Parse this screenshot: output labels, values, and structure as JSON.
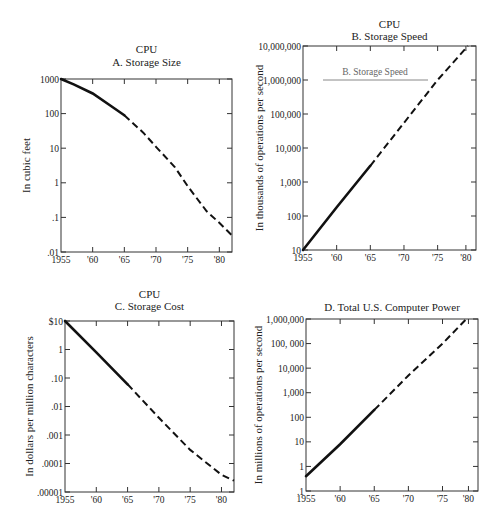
{
  "chart_data": [
    {
      "id": "A",
      "type": "line",
      "supertitle": "CPU",
      "title": "A. Storage Size",
      "xlabel": "",
      "ylabel": "In cubic feet",
      "yscale": "log",
      "ylim": [
        0.01,
        1000
      ],
      "xlim": [
        1955,
        1982
      ],
      "x_tick_labels": [
        "1955",
        "'60",
        "'65",
        "'70",
        "'75",
        "'80"
      ],
      "x_ticks": [
        1955,
        1960,
        1965,
        1970,
        1975,
        1980
      ],
      "y_tick_labels": [
        "1000",
        "100",
        "10",
        "1",
        ".1",
        ".01"
      ],
      "y_ticks": [
        1000,
        100,
        10,
        1,
        0.1,
        0.01
      ],
      "grid": false,
      "solid_until": 1965,
      "x": [
        1955,
        1957,
        1960,
        1963,
        1965,
        1968,
        1970,
        1973,
        1975,
        1978,
        1980,
        1982
      ],
      "values": [
        1000,
        700,
        380,
        160,
        90,
        28,
        11,
        2.8,
        0.8,
        0.15,
        0.07,
        0.03
      ]
    },
    {
      "id": "B",
      "type": "line",
      "supertitle": "CPU",
      "title": "B. Storage Speed",
      "legend_label": "B. Storage Speed",
      "xlabel": "",
      "ylabel": "In thousands of operations per second",
      "yscale": "log",
      "ylim": [
        10,
        10000000
      ],
      "xlim": [
        1955,
        1980.7
      ],
      "x_tick_labels": [
        "1955",
        "'60",
        "'65",
        "'70",
        "'75",
        "'80"
      ],
      "x_ticks": [
        1955,
        1960,
        1965,
        1970,
        1975,
        1979.2
      ],
      "y_tick_labels": [
        "10,000,000",
        "1,000,000",
        "100,000",
        "10,000",
        "1,000",
        "100",
        "10"
      ],
      "y_ticks": [
        10000000,
        1000000,
        100000,
        10000,
        1000,
        100,
        10
      ],
      "grid": false,
      "solid_until": 1965,
      "x": [
        1955,
        1960,
        1965,
        1970,
        1975,
        1979.5
      ],
      "values": [
        10,
        180,
        3000,
        55000,
        1000000,
        10000000
      ]
    },
    {
      "id": "C",
      "type": "line",
      "supertitle": "CPU",
      "title": "C. Storage Cost",
      "xlabel": "",
      "ylabel": "In dollars per million characters",
      "yscale": "log",
      "ylim": [
        1e-05,
        10
      ],
      "xlim": [
        1955,
        1982
      ],
      "x_tick_labels": [
        "1955",
        "'60",
        "'65",
        "'70",
        "'75",
        "'80"
      ],
      "x_ticks": [
        1955,
        1960,
        1965,
        1970,
        1975,
        1980
      ],
      "y_tick_labels": [
        "$10",
        "1",
        ".10",
        ".01",
        ".001",
        ".0001",
        ".00001"
      ],
      "y_ticks": [
        10,
        1,
        0.1,
        0.01,
        0.001,
        0.0001,
        1e-05
      ],
      "grid": false,
      "solid_until": 1965,
      "x": [
        1955,
        1960,
        1965,
        1970,
        1975,
        1980,
        1982
      ],
      "values": [
        10,
        0.8,
        0.06,
        0.004,
        0.0003,
        4e-05,
        2.5e-05
      ]
    },
    {
      "id": "D",
      "type": "line",
      "supertitle": "",
      "title": "D. Total U.S. Computer Power",
      "xlabel": "",
      "ylabel": "In millions of operations per second",
      "yscale": "log",
      "ylim": [
        0.1,
        1000000
      ],
      "xlim": [
        1955,
        1980.2
      ],
      "x_tick_labels": [
        "1955",
        "'60",
        "'65",
        "'70",
        "'75",
        "'80"
      ],
      "x_ticks": [
        1955,
        1960,
        1965,
        1970,
        1975,
        1978.8
      ],
      "y_tick_labels": [
        "1,000,000",
        "100, 000",
        "10,000",
        "1,000",
        "100",
        "10",
        "1",
        ".1"
      ],
      "y_ticks": [
        1000000,
        100000,
        10000,
        1000,
        100,
        10,
        1,
        0.1
      ],
      "grid": false,
      "solid_until": 1965,
      "x": [
        1955,
        1960,
        1965,
        1970,
        1975,
        1978.5
      ],
      "values": [
        0.4,
        8,
        200,
        5000,
        100000,
        1000000
      ]
    }
  ]
}
